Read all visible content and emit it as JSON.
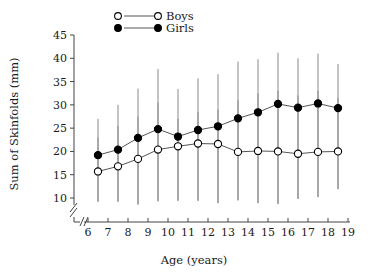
{
  "chart_data": {
    "type": "line",
    "title": "",
    "xlabel": "Age (years)",
    "ylabel": "Sum of Skinfolds (mm)",
    "xlim": [
      5.6,
      19.0
    ],
    "ylim": [
      8.6,
      45.0
    ],
    "xticks": [
      6,
      7,
      8,
      9,
      10,
      11,
      12,
      13,
      14,
      15,
      16,
      17,
      18,
      19
    ],
    "yticks": [
      10,
      15,
      20,
      25,
      30,
      35,
      40,
      45
    ],
    "grid": false,
    "axis_break_x": true,
    "axis_break_y": true,
    "legend_position": "top-center",
    "error_bars": "asymmetric vertical range bars",
    "x": [
      6.5,
      7.5,
      8.5,
      9.5,
      10.5,
      11.5,
      12.5,
      13.5,
      14.5,
      15.5,
      16.5,
      17.5,
      18.5
    ],
    "series": [
      {
        "name": "Boys",
        "marker": "open-circle",
        "color": "#000000",
        "fill": "#ffffff",
        "values": [
          15.7,
          16.8,
          18.4,
          20.4,
          21.1,
          21.7,
          21.6,
          19.9,
          20.1,
          20.0,
          19.5,
          19.9,
          20.0
        ],
        "err_high": [
          23.0,
          25.5,
          27.5,
          30.5,
          27.0,
          28.5,
          29.0,
          31.0,
          32.5,
          33.0,
          32.0,
          33.0,
          31.5
        ],
        "err_low": [
          9.2,
          9.2,
          8.6,
          9.3,
          9.4,
          9.4,
          8.9,
          9.5,
          8.9,
          8.7,
          9.8,
          10.2,
          11.9
        ]
      },
      {
        "name": "Girls",
        "marker": "filled-circle",
        "color": "#000000",
        "fill": "#000000",
        "values": [
          19.2,
          20.4,
          22.9,
          24.8,
          23.2,
          24.6,
          25.4,
          27.1,
          28.4,
          30.2,
          29.4,
          30.3,
          29.3
        ],
        "err_high": [
          27.0,
          30.0,
          33.5,
          37.7,
          33.4,
          35.7,
          36.6,
          39.3,
          39.8,
          41.2,
          40.0,
          41.0,
          38.8
        ],
        "err_low": [
          9.2,
          9.2,
          8.6,
          9.3,
          9.4,
          9.4,
          8.9,
          9.5,
          8.9,
          8.7,
          9.8,
          10.2,
          11.9
        ]
      }
    ]
  },
  "legend": {
    "entries": [
      {
        "label": "Boys",
        "marker": "open-circle"
      },
      {
        "label": "Girls",
        "marker": "filled-circle"
      }
    ]
  },
  "axes": {
    "x_title": "Age (years)",
    "y_title": "Sum of Skinfolds (mm)"
  }
}
